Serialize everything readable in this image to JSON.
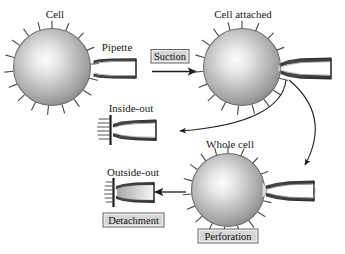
{
  "figure": {
    "background_color": "#ffffff",
    "line_color": "#1d1d1d",
    "cell_fill_light": "#ffffff",
    "cell_fill_mid": "#b9b9b9",
    "cell_fill_dark": "#8a8a8a",
    "pipette_color": "#3a3a3a",
    "box_fill": "#d6d6d6"
  },
  "labels": {
    "cell": "Cell",
    "pipette": "Pipette",
    "cell_attached": "Cell attached",
    "inside_out": "Inside-out",
    "whole_cell": "Whole cell",
    "outside_out": "Outside-out"
  },
  "steps": [
    {
      "id": "suction",
      "label": "Suction"
    },
    {
      "id": "perforation",
      "label": "Perforation"
    },
    {
      "id": "detachment",
      "label": "Detachment"
    }
  ],
  "panels": [
    {
      "id": "cell",
      "label": "Cell",
      "label_x": 55,
      "label_y": 18,
      "cell": {
        "cx": 52,
        "cy": 67,
        "r": 40
      },
      "pipette": null
    },
    {
      "id": "cell-attached",
      "label": "Cell attached",
      "label_x": 243,
      "label_y": 18,
      "cell": {
        "cx": 242,
        "cy": 67,
        "r": 40
      },
      "pipette": {
        "tip_x": 279,
        "tip_y": 68
      }
    },
    {
      "id": "inside-out",
      "label": "Inside-out",
      "label_x": 131,
      "label_y": 112,
      "cell": null,
      "pipette": {
        "tip_x": 103,
        "tip_y": 130
      }
    },
    {
      "id": "whole-cell",
      "label": "Whole cell",
      "label_x": 230,
      "label_y": 148,
      "cell": {
        "cx": 228,
        "cy": 190,
        "r": 38
      },
      "pipette": {
        "tip_x": 264,
        "tip_y": 190
      }
    },
    {
      "id": "outside-out",
      "label": "Outside-out",
      "label_x": 133,
      "label_y": 176,
      "cell": null,
      "pipette": {
        "tip_x": 108,
        "tip_y": 192
      }
    }
  ],
  "arrows": [
    {
      "id": "suction-arrow",
      "type": "straight",
      "from": "pipette",
      "to": "cell-attached",
      "label": "Suction"
    },
    {
      "id": "inside-out-arrow",
      "type": "curved",
      "from": "cell-attached",
      "to": "inside-out"
    },
    {
      "id": "whole-cell-arrow",
      "type": "curved",
      "from": "cell-attached",
      "to": "whole-cell",
      "label": "Perforation"
    },
    {
      "id": "outside-out-arrow",
      "type": "straight",
      "from": "whole-cell",
      "to": "outside-out",
      "label": "Detachment"
    }
  ]
}
